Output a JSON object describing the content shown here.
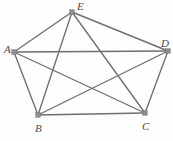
{
  "figure": {
    "background_color": "#fdfdfd",
    "edge_color": "#6f6f72",
    "vertex_color": "#8d8d90",
    "label_color": "#4a4a4d",
    "width": 173,
    "height": 141
  },
  "chart_data": {
    "type": "diagram",
    "graph_type": "complete-graph",
    "notation": "K5",
    "title": "",
    "vertices": [
      {
        "id": "A",
        "label": "A",
        "x": 14,
        "y": 52,
        "label_x": 4,
        "label_y": 44
      },
      {
        "id": "B",
        "label": "B",
        "x": 38,
        "y": 115,
        "label_x": 35,
        "label_y": 123
      },
      {
        "id": "C",
        "label": "C",
        "x": 145,
        "y": 113,
        "label_x": 142,
        "label_y": 121
      },
      {
        "id": "D",
        "label": "D",
        "x": 168,
        "y": 51,
        "label_x": 161,
        "label_y": 38
      },
      {
        "id": "E",
        "label": "E",
        "x": 72,
        "y": 12,
        "label_x": 77,
        "label_y": 1
      }
    ],
    "edges": [
      {
        "from": "A",
        "to": "B",
        "kind": "side"
      },
      {
        "from": "B",
        "to": "C",
        "kind": "side"
      },
      {
        "from": "C",
        "to": "D",
        "kind": "side"
      },
      {
        "from": "D",
        "to": "E",
        "kind": "side"
      },
      {
        "from": "E",
        "to": "A",
        "kind": "side"
      },
      {
        "from": "A",
        "to": "C",
        "kind": "diagonal"
      },
      {
        "from": "A",
        "to": "D",
        "kind": "diagonal"
      },
      {
        "from": "B",
        "to": "D",
        "kind": "diagonal"
      },
      {
        "from": "B",
        "to": "E",
        "kind": "diagonal"
      },
      {
        "from": "C",
        "to": "E",
        "kind": "diagonal"
      }
    ],
    "vertex_count": 5,
    "edge_count": 10
  }
}
